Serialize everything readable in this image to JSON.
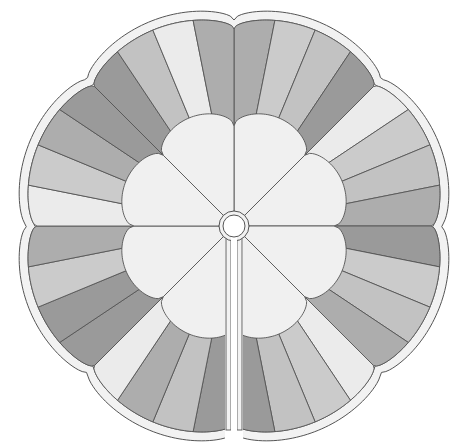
{
  "palette": {
    "lightest": "#ebebeb",
    "light": "#cbcbcb",
    "light_alt": "#c2c2c2",
    "medium": "#adadad",
    "dark": "#9a9a9a",
    "center_fill": "#f0f0f0",
    "binding": "#f2f2f2",
    "outline": "#555555",
    "hole": "#ffffff"
  },
  "structure": {
    "outer_lobes": 8,
    "stripes_per_lobe": 4,
    "inner_petals": 8,
    "has_center_hole": true,
    "has_back_opening_slit": true
  },
  "lobes": [
    {
      "name": "lobe-top-right",
      "stripes": [
        "medium",
        "light",
        "light_alt",
        "dark"
      ]
    },
    {
      "name": "lobe-upper-right",
      "stripes": [
        "lightest",
        "light",
        "light_alt",
        "medium"
      ]
    },
    {
      "name": "lobe-lower-right",
      "stripes": [
        "dark",
        "light",
        "light_alt",
        "medium"
      ]
    },
    {
      "name": "lobe-bottom-right",
      "stripes": [
        "lightest",
        "light",
        "light_alt",
        "dark"
      ]
    },
    {
      "name": "lobe-bottom-left",
      "stripes": [
        "dark",
        "light_alt",
        "medium",
        "lightest"
      ]
    },
    {
      "name": "lobe-lower-left",
      "stripes": [
        "dark",
        "dark",
        "light",
        "medium"
      ]
    },
    {
      "name": "lobe-upper-left",
      "stripes": [
        "lightest",
        "light",
        "medium",
        "dark"
      ]
    },
    {
      "name": "lobe-top-left",
      "stripes": [
        "dark",
        "light_alt",
        "lightest",
        "medium"
      ]
    }
  ]
}
